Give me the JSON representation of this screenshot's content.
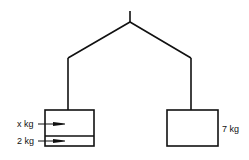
{
  "diagram": {
    "type": "balance-scale",
    "left_pan": {
      "weights": [
        {
          "label": "x kg",
          "variable": "x",
          "unit": "kg"
        },
        {
          "label": "2 kg",
          "value": 2,
          "unit": "kg"
        }
      ]
    },
    "right_pan": {
      "weights": [
        {
          "label": "7 kg",
          "value": 7,
          "unit": "kg"
        }
      ]
    },
    "colors": {
      "line": "#111111",
      "background": "#ffffff"
    }
  }
}
